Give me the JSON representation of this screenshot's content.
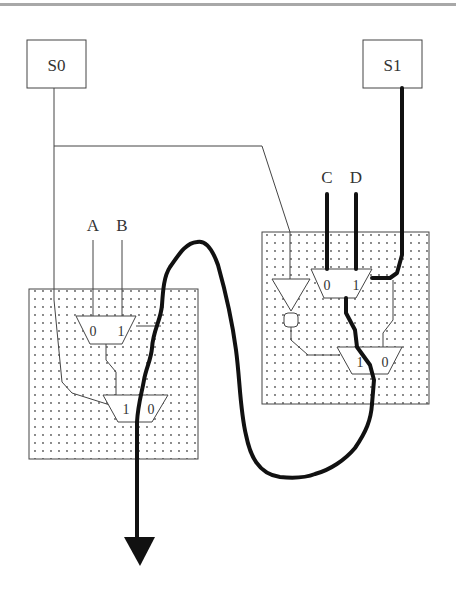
{
  "diagram": {
    "type": "multiplexer-circuit",
    "selects": {
      "s0": "S0",
      "s1": "S1"
    },
    "inputs": {
      "a": "A",
      "b": "B",
      "c": "C",
      "d": "D"
    },
    "left_block": {
      "mux1": {
        "in0": "0",
        "in1": "1"
      },
      "mux2": {
        "in1": "1",
        "in0": "0"
      }
    },
    "right_block": {
      "mux1": {
        "in0": "0",
        "in1": "1"
      },
      "mux2": {
        "in1": "1",
        "in0": "0"
      }
    },
    "colors": {
      "line": "#333333",
      "thick_path": "#111111",
      "block_fill": "#f4f4f4",
      "dots": "#555555",
      "top_rule": "#a8a8a8"
    }
  }
}
